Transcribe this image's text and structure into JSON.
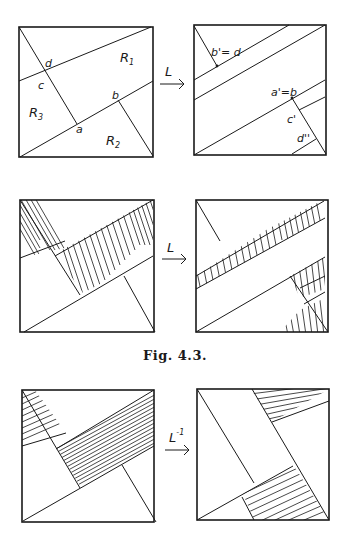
{
  "figure": {
    "caption": "Fig. 4.3.",
    "rows": [
      {
        "map_label": "L",
        "map_superscript": "",
        "left_panel": {
          "regions": [
            {
              "label": "R",
              "subscript": "1"
            },
            {
              "label": "R",
              "subscript": "2"
            },
            {
              "label": "R",
              "subscript": "3"
            }
          ],
          "points": [
            "a",
            "b",
            "c",
            "d"
          ]
        },
        "right_panel": {
          "points": [
            "b'= d",
            "a'=b",
            "c'",
            "d''"
          ]
        }
      },
      {
        "map_label": "L",
        "map_superscript": "",
        "hatching": "vertical"
      },
      {
        "map_label": "L",
        "map_superscript": "-1",
        "hatching": "horizontal"
      }
    ],
    "colors": {
      "ink": "#1a1a1a",
      "background": "#ffffff"
    }
  }
}
